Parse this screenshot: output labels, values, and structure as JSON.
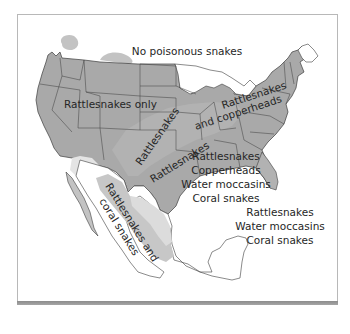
{
  "map": {
    "subject": "Distribution of poisonous snakes in the United States and Mexico",
    "colors": {
      "dark_region": "#a9a9a9",
      "mid_region": "#c3c3c3",
      "light_region": "#dadada",
      "lightest_region": "#ebebeb",
      "border_line": "#3c3c3c",
      "text": "#262626",
      "frame": "#b8b8b8",
      "shadow": "#999999"
    },
    "labels": {
      "none": "No poisonous snakes",
      "rattlesnakes_only": "Rattlesnakes only",
      "rattlesnakes_west": "Rattlesnakes",
      "rattlesnakes_copperheads_diag": "Rattlesnakes and copperheads",
      "rattlesnakes_copperheads_ne_1": "Rattlesnakes",
      "rattlesnakes_copperheads_ne_2": "and copperheads",
      "rattlesnakes_coral_1": "Rattlesnakes and",
      "rattlesnakes_coral_2": "coral snakes",
      "southeast": [
        "Rattlesnakes",
        "Copperheads",
        "Water moccasins",
        "Coral snakes"
      ],
      "mexico_east": [
        "Rattlesnakes",
        "Water moccasins",
        "Coral snakes"
      ]
    }
  }
}
